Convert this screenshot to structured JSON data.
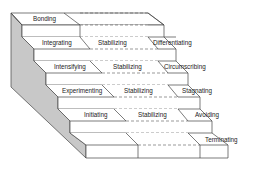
{
  "diagram": {
    "type": "staircase",
    "steps": [
      {
        "left": "Bonding",
        "middle": "",
        "right": ""
      },
      {
        "left": "Integrating",
        "middle": "Stabilizing",
        "right": "Differentiating"
      },
      {
        "left": "Intensifying",
        "middle": "Stabilizing",
        "right": "Circumscribing"
      },
      {
        "left": "Experimenting",
        "middle": "Stabilizing",
        "right": "Stagnating"
      },
      {
        "left": "Initiating",
        "middle": "Stabilizing",
        "right": "Avoiding"
      },
      {
        "left": "",
        "middle": "",
        "right": "Terminating"
      }
    ],
    "colors": {
      "side_panel": "#c8c8c8",
      "lines": "#444444",
      "background": "#ffffff"
    }
  }
}
